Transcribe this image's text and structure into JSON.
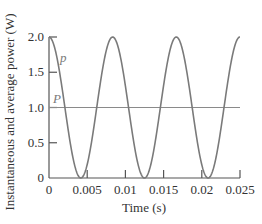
{
  "chart_data": {
    "type": "line",
    "title": "",
    "xlabel": "Time (s)",
    "ylabel": "Instantaneous and average power (W)",
    "xlim": [
      0,
      0.025
    ],
    "ylim": [
      0,
      2.0
    ],
    "x_ticks": [
      "0",
      "0.005",
      "0.01",
      "0.015",
      "0.02",
      "0.025"
    ],
    "y_ticks": [
      "0",
      "0.5",
      "1.0",
      "1.5",
      "2.0"
    ],
    "grid": false,
    "series": [
      {
        "name": "p",
        "description": "instantaneous power p(t) = 1 + cos(2π·120·t)",
        "x": [
          0,
          0.00417,
          0.00833,
          0.0125,
          0.01667,
          0.02083,
          0.025
        ],
        "values": [
          2.0,
          0.0,
          2.0,
          0.0,
          2.0,
          0.0,
          2.0
        ]
      },
      {
        "name": "P",
        "description": "average power",
        "x": [
          0,
          0.025
        ],
        "values": [
          1.0,
          1.0
        ]
      }
    ],
    "annotations": [
      "p",
      "P"
    ],
    "colors": {
      "curve": "#7a7a7a",
      "axes": "#555555"
    }
  }
}
